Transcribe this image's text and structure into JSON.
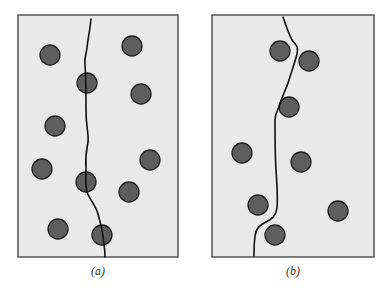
{
  "figure": {
    "panel_fill": "#e9e9e9",
    "panel_stroke": "#555555",
    "particle_fill": "#5e5e5e",
    "particle_stroke": "#1e1e1e",
    "boundary_stroke": "#111111",
    "panels": [
      {
        "id": "a",
        "caption": "(a)",
        "frame": {
          "x": 18,
          "y": 15,
          "w": 160,
          "h": 242
        },
        "particles": [
          {
            "cx": 50,
            "cy": 55,
            "r": 10
          },
          {
            "cx": 132,
            "cy": 46,
            "r": 10
          },
          {
            "cx": 87,
            "cy": 83,
            "r": 10
          },
          {
            "cx": 141,
            "cy": 94,
            "r": 10
          },
          {
            "cx": 55,
            "cy": 126,
            "r": 10
          },
          {
            "cx": 42,
            "cy": 169,
            "r": 10
          },
          {
            "cx": 150,
            "cy": 160,
            "r": 10
          },
          {
            "cx": 86,
            "cy": 182,
            "r": 10
          },
          {
            "cx": 129,
            "cy": 192,
            "r": 10
          },
          {
            "cx": 58,
            "cy": 229,
            "r": 10
          },
          {
            "cx": 102,
            "cy": 235,
            "r": 10
          }
        ],
        "boundary": "M91,19 C90,30 88,38 87,48 C86,55 84,58 85,66 C86,75 86,90 86,110 C86,128 89,134 88,142 C87,148 85,155 86,168 C86,178 85,185 87,192 C90,200 96,206 98,214 C100,222 102,228 103,236 C104,244 105,250 105,257"
      },
      {
        "id": "b",
        "caption": "(b)",
        "frame": {
          "x": 212,
          "y": 15,
          "w": 162,
          "h": 242
        },
        "particles": [
          {
            "cx": 280,
            "cy": 51,
            "r": 10
          },
          {
            "cx": 309,
            "cy": 61,
            "r": 10
          },
          {
            "cx": 289,
            "cy": 107,
            "r": 10
          },
          {
            "cx": 242,
            "cy": 153,
            "r": 10
          },
          {
            "cx": 301,
            "cy": 162,
            "r": 10
          },
          {
            "cx": 338,
            "cy": 211,
            "r": 10
          },
          {
            "cx": 258,
            "cy": 205,
            "r": 10
          },
          {
            "cx": 275,
            "cy": 235,
            "r": 10
          }
        ],
        "boundary": "M283,17 C286,26 289,34 292,40 C295,44 299,46 297,54 C295,62 292,70 289,80 C286,90 282,96 280,104 C278,110 275,113 275,120 C275,135 275,155 276,170 C277,185 278,198 277,208 C276,216 272,219 266,222 C260,225 256,228 255,236 C254,244 254,250 254,256"
      }
    ]
  }
}
